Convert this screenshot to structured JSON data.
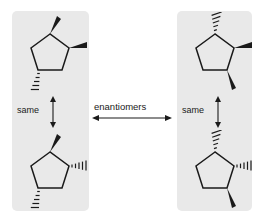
{
  "figure": {
    "background_color": "#ffffff",
    "panel_color": "#e9e9e9",
    "line_color": "#1a1a1a"
  },
  "labels": {
    "same_left": "same",
    "same_right": "same",
    "enantiomers": "enantiomers"
  },
  "arrows": {
    "left": {
      "name": "vertical-double-headed-arrow",
      "direction": "vertical",
      "heads": "both"
    },
    "right": {
      "name": "vertical-double-headed-arrow",
      "direction": "vertical",
      "heads": "both"
    },
    "center": {
      "name": "horizontal-double-headed-arrow",
      "direction": "horizontal",
      "heads": "both"
    }
  },
  "panels": [
    {
      "id": "left",
      "label": "left-structure-group"
    },
    {
      "id": "right",
      "label": "right-structure-group"
    }
  ],
  "molecules": [
    {
      "id": "top-left",
      "ring": "cyclopentane",
      "substituents": [
        {
          "position": "top",
          "bond": "wedge",
          "direction": "up-right"
        },
        {
          "position": "right",
          "bond": "wedge",
          "direction": "right"
        },
        {
          "position": "bottom",
          "bond": "hash",
          "direction": "down-left"
        }
      ]
    },
    {
      "id": "bottom-left",
      "ring": "cyclopentane",
      "substituents": [
        {
          "position": "top",
          "bond": "wedge",
          "direction": "up-right"
        },
        {
          "position": "right",
          "bond": "hash",
          "direction": "right"
        },
        {
          "position": "bottom",
          "bond": "hash",
          "direction": "down-left"
        }
      ]
    },
    {
      "id": "top-right",
      "ring": "cyclopentane",
      "substituents": [
        {
          "position": "top",
          "bond": "hash",
          "direction": "up-right"
        },
        {
          "position": "right",
          "bond": "wedge",
          "direction": "right"
        },
        {
          "position": "bottom",
          "bond": "wedge",
          "direction": "down-right"
        }
      ]
    },
    {
      "id": "bottom-right",
      "ring": "cyclopentane",
      "substituents": [
        {
          "position": "top",
          "bond": "hash",
          "direction": "up-right"
        },
        {
          "position": "right",
          "bond": "hash",
          "direction": "right"
        },
        {
          "position": "bottom",
          "bond": "wedge",
          "direction": "down-right"
        }
      ]
    }
  ]
}
